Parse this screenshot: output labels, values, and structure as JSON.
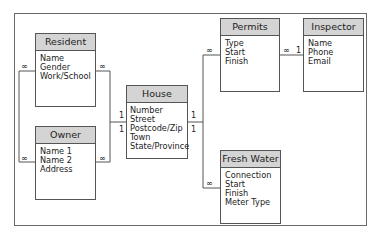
{
  "diagram": {
    "type": "entity-relationship",
    "entities": [
      {
        "name": "Resident",
        "fields": [
          "Name",
          "Gender",
          "Work/School"
        ]
      },
      {
        "name": "Owner",
        "fields": [
          "Name 1",
          "Name 2",
          "Address"
        ]
      },
      {
        "name": "House",
        "fields": [
          "Number",
          "Street",
          "Postcode/Zip",
          "Town",
          "State/Province"
        ]
      },
      {
        "name": "Permits",
        "fields": [
          "Type",
          "Start",
          "Finish"
        ]
      },
      {
        "name": "Inspector",
        "fields": [
          "Name",
          "Phone",
          "Email"
        ]
      },
      {
        "name": "Fresh Water",
        "fields": [
          "Connection",
          "Start",
          "Finish",
          "Meter Type"
        ]
      }
    ],
    "relationships": [
      {
        "from": "Resident",
        "to": "Owner",
        "from_card": "∞",
        "to_card": "∞"
      },
      {
        "from": "Resident",
        "to": "House",
        "from_card": "∞",
        "to_card": "1"
      },
      {
        "from": "Owner",
        "to": "House",
        "from_card": "∞",
        "to_card": "1"
      },
      {
        "from": "House",
        "to": "Permits",
        "from_card": "1",
        "to_card": "∞"
      },
      {
        "from": "House",
        "to": "Fresh Water",
        "from_card": "1",
        "to_card": "∞"
      },
      {
        "from": "Permits",
        "to": "Inspector",
        "from_card": "∞",
        "to_card": "1"
      }
    ],
    "labels": {
      "many": "∞",
      "one": "1"
    }
  }
}
